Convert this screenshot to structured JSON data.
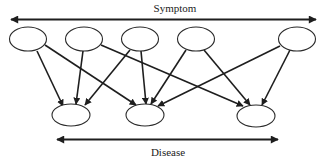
{
  "diagram": {
    "top_label": "Symptom",
    "bottom_label": "Disease",
    "colors": {
      "line": "#1e1e1e",
      "node_stroke": "#2a2a2a",
      "background": "#ffffff"
    },
    "symptom_nodes": [
      {
        "id": "S1",
        "cx": 28,
        "cy": 39
      },
      {
        "id": "S2",
        "cx": 84,
        "cy": 39
      },
      {
        "id": "S3",
        "cx": 140,
        "cy": 39
      },
      {
        "id": "S4",
        "cx": 196,
        "cy": 39
      },
      {
        "id": "S5",
        "cx": 297,
        "cy": 39
      }
    ],
    "disease_nodes": [
      {
        "id": "D1",
        "cx": 71,
        "cy": 115
      },
      {
        "id": "D2",
        "cx": 145,
        "cy": 115
      },
      {
        "id": "D3",
        "cx": 256,
        "cy": 116
      }
    ],
    "edges": [
      {
        "from": "S1",
        "to": "D1",
        "x1": 37,
        "y1": 51,
        "x2": 63,
        "y2": 106
      },
      {
        "from": "S1",
        "to": "D2",
        "x1": 45,
        "y1": 45,
        "x2": 136,
        "y2": 105
      },
      {
        "from": "S2",
        "to": "D1",
        "x1": 83,
        "y1": 51,
        "x2": 76,
        "y2": 104
      },
      {
        "from": "S2",
        "to": "D3",
        "x1": 101,
        "y1": 45,
        "x2": 243,
        "y2": 106
      },
      {
        "from": "S3",
        "to": "D1",
        "x1": 130,
        "y1": 50,
        "x2": 85,
        "y2": 105
      },
      {
        "from": "S3",
        "to": "D2",
        "x1": 141,
        "y1": 51,
        "x2": 146,
        "y2": 104
      },
      {
        "from": "S4",
        "to": "D2",
        "x1": 186,
        "y1": 50,
        "x2": 151,
        "y2": 104
      },
      {
        "from": "S4",
        "to": "D3",
        "x1": 204,
        "y1": 50,
        "x2": 250,
        "y2": 105
      },
      {
        "from": "S5",
        "to": "D2",
        "x1": 280,
        "y1": 46,
        "x2": 158,
        "y2": 106
      },
      {
        "from": "S5",
        "to": "D3",
        "x1": 290,
        "y1": 50,
        "x2": 262,
        "y2": 105
      }
    ]
  }
}
